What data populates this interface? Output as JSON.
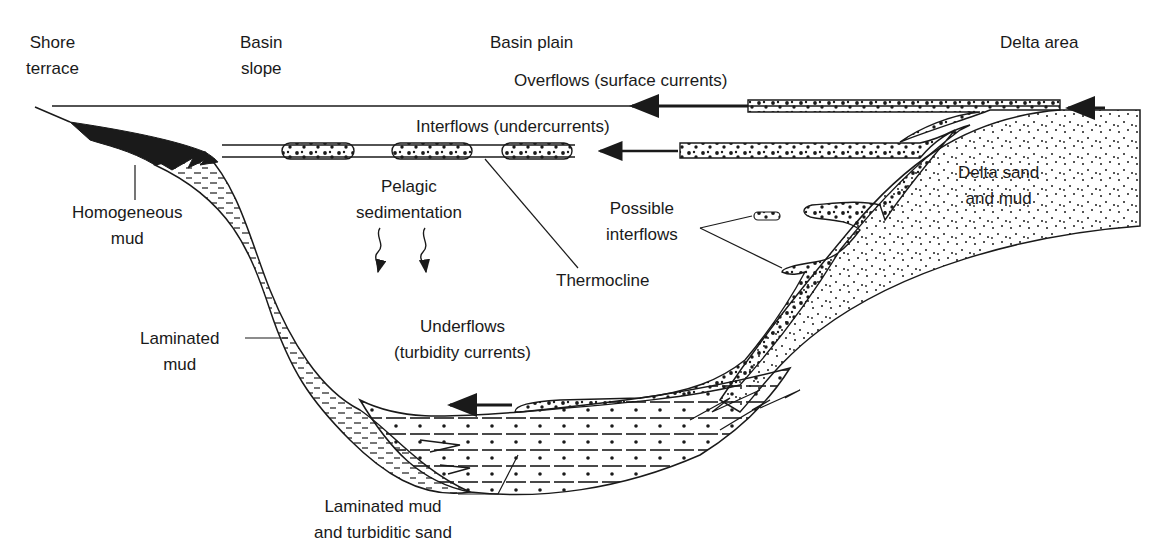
{
  "zones": {
    "shore_terrace": [
      "Shore",
      "terrace"
    ],
    "basin_slope": [
      "Basin",
      "slope"
    ],
    "basin_plain": "Basin plain",
    "delta_area": "Delta area"
  },
  "flows": {
    "overflows": "Overflows (surface currents)",
    "interflows": "Interflows (undercurrents)",
    "underflows": [
      "Underflows",
      "(turbidity currents)"
    ],
    "possible_interflows": [
      "Possible",
      "interflows"
    ]
  },
  "features": {
    "pelagic": [
      "Pelagic",
      "sedimentation"
    ],
    "thermocline": "Thermocline"
  },
  "deposits": {
    "homogeneous_mud": [
      "Homogeneous",
      "mud"
    ],
    "laminated_mud": [
      "Laminated",
      "mud"
    ],
    "delta_sand_mud": [
      "Delta sand",
      "and mud"
    ],
    "laminated_turbiditic": [
      "Laminated mud",
      "and turbiditic sand"
    ]
  },
  "colors": {
    "ink": "#1a1a1a",
    "background": "#ffffff"
  }
}
